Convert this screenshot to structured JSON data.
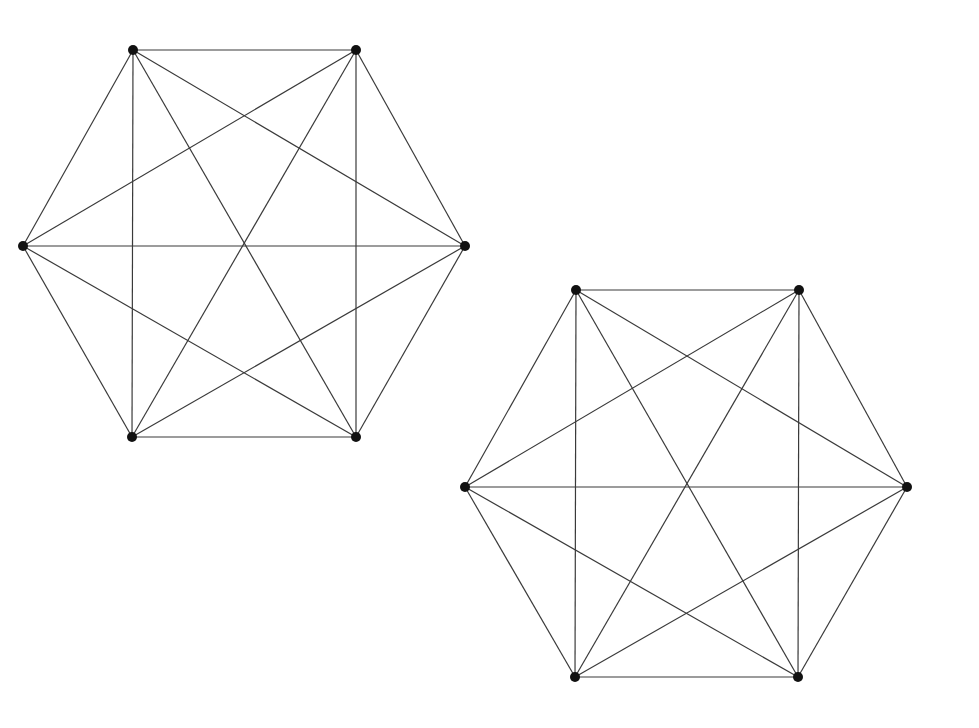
{
  "diagram": {
    "type": "graph",
    "graphs": [
      {
        "name": "K6-left",
        "vertices": [
          {
            "id": 0,
            "x": 133,
            "y": 50
          },
          {
            "id": 1,
            "x": 356,
            "y": 50
          },
          {
            "id": 2,
            "x": 465,
            "y": 246
          },
          {
            "id": 3,
            "x": 356,
            "y": 437
          },
          {
            "id": 4,
            "x": 132,
            "y": 437
          },
          {
            "id": 5,
            "x": 23,
            "y": 246
          }
        ]
      },
      {
        "name": "K6-right",
        "vertices": [
          {
            "id": 0,
            "x": 576,
            "y": 290
          },
          {
            "id": 1,
            "x": 799,
            "y": 290
          },
          {
            "id": 2,
            "x": 907,
            "y": 487
          },
          {
            "id": 3,
            "x": 798,
            "y": 677
          },
          {
            "id": 4,
            "x": 575,
            "y": 677
          },
          {
            "id": 5,
            "x": 465,
            "y": 487
          }
        ]
      }
    ],
    "edges": "complete",
    "colors": {
      "edge": "#3a3a3a",
      "vertex": "#111111",
      "background": "#ffffff"
    }
  }
}
